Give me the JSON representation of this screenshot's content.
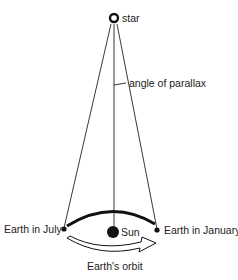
{
  "diagram": {
    "labels": {
      "star": "star",
      "angle": "angle of parallax",
      "earth_july": "Earth in July",
      "sun": "Sun",
      "earth_january": "Earth in January",
      "orbit": "Earth's orbit"
    },
    "colors": {
      "line": "#222222",
      "background": "#ffffff"
    }
  }
}
